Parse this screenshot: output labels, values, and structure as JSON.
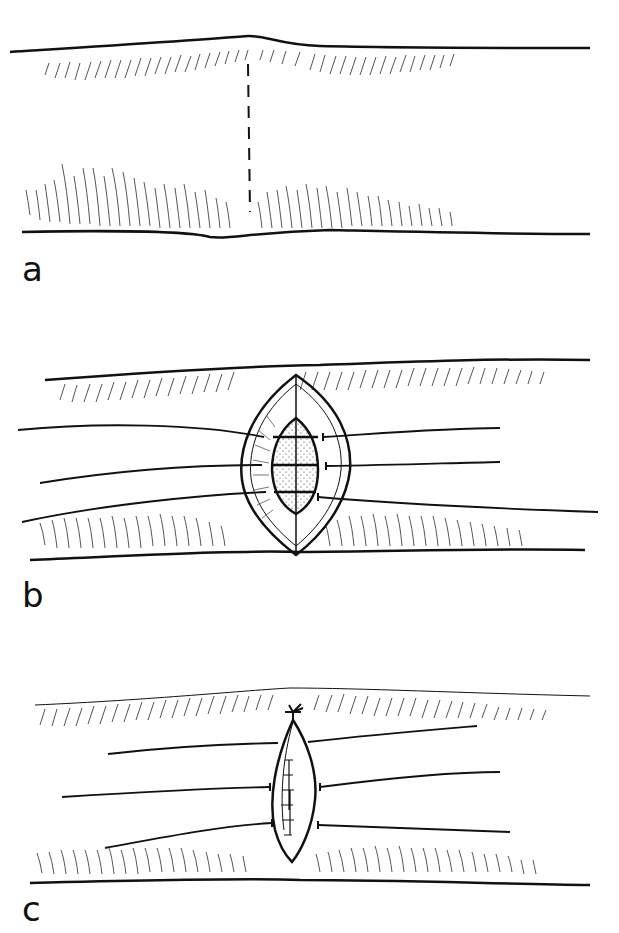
{
  "panels": [
    {
      "label": "a",
      "description": "Intact tissue with dashed incision line"
    },
    {
      "label": "b",
      "description": "Open elliptical wound with sutures placed across layers"
    },
    {
      "label": "c",
      "description": "Sutures tightened and knot tied, wound closed"
    }
  ],
  "colors": {
    "ink": "#111111",
    "hatch": "#555555",
    "background": "#ffffff"
  }
}
